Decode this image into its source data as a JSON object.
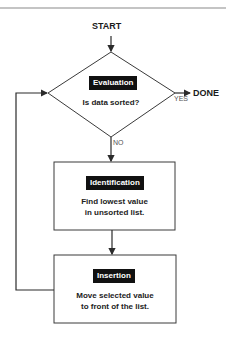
{
  "diagram": {
    "type": "flowchart",
    "start_label": "START",
    "end_label": "DONE",
    "decision": {
      "tag": "Evaluation",
      "question": "Is data sorted?",
      "yes_label": "YES",
      "no_label": "NO"
    },
    "steps": [
      {
        "tag": "Identification",
        "text_line1": "Find lowest value",
        "text_line2": "in unsorted list."
      },
      {
        "tag": "Insertion",
        "text_line1": "Move selected value",
        "text_line2": "to front of the list."
      }
    ],
    "colors": {
      "line": "#2b2b2b",
      "tag_bg": "#111111",
      "tag_text": "#ffffff",
      "top_rule": "#888888"
    }
  }
}
